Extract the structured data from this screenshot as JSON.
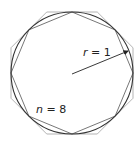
{
  "diagram": {
    "title": "",
    "center": [
      72,
      73
    ],
    "radius": 61,
    "sides": 8,
    "colors": {
      "circle": "#333333",
      "inscribed": "#666666",
      "circumscribed": "#aaaaaa",
      "radius_line": "#222222",
      "text": "#222222"
    },
    "labels": {
      "radius_var": "r",
      "radius_eq": " = 1",
      "sides_var": "n",
      "sides_eq": " = 8"
    }
  }
}
